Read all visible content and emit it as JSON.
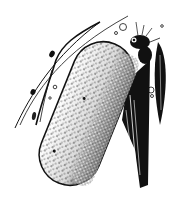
{
  "illustration": {
    "subject": "ink drawing of an elongated stippled egg case attached to a plant stem with an insect at its top",
    "style": "black and white pen-and-ink stipple",
    "colors": {
      "ink": "#111111",
      "paper": "#ffffff"
    },
    "elements": [
      "egg-case",
      "plant-stem",
      "insect",
      "grass-blades",
      "small-bugs",
      "bubbles"
    ]
  }
}
